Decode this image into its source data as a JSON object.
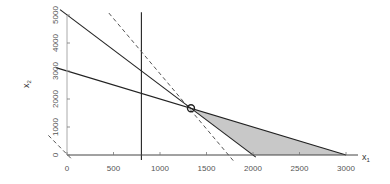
{
  "chart_data": {
    "type": "line",
    "title": "",
    "xlabel": "x1",
    "ylabel": "x2",
    "xlim": [
      0,
      3000
    ],
    "ylim": [
      0,
      5000
    ],
    "grid": false,
    "x_ticks": [
      0,
      500,
      1000,
      1500,
      2000,
      2500,
      3000
    ],
    "y_ticks": [
      0,
      1000,
      2000,
      3000,
      4000,
      5000
    ],
    "series": [
      {
        "name": "constraint-1",
        "style": "solid",
        "equation": "5x1 + 2x2 = 10000",
        "points": [
          [
            -75,
            5190
          ],
          [
            2030,
            -75
          ]
        ]
      },
      {
        "name": "constraint-2",
        "style": "solid",
        "equation": "x1 + x2 = 3000",
        "points": [
          [
            -120,
            3120
          ],
          [
            3000,
            0
          ]
        ]
      },
      {
        "name": "constraint-3",
        "style": "solid",
        "equation": "x1 = 800",
        "points": [
          [
            800,
            5100
          ],
          [
            800,
            -180
          ]
        ]
      },
      {
        "name": "objective-optimal",
        "style": "dashed",
        "equation": "4x1 + x2 = 7000",
        "points": [
          [
            450,
            5070
          ],
          [
            1800,
            -250
          ]
        ]
      },
      {
        "name": "objective-origin",
        "style": "dashed",
        "equation": "4x1 + x2 = 0",
        "points": [
          [
            -200,
            700
          ],
          [
            60,
            -180
          ]
        ]
      }
    ],
    "feasible_region": {
      "fill": "#c8c8c8",
      "vertices": [
        [
          1333,
          1667
        ],
        [
          3000,
          0
        ],
        [
          2000,
          0
        ]
      ]
    },
    "optimal_point": {
      "x": 1333,
      "y": 1667,
      "marker": "open-circle"
    }
  },
  "axes": {
    "x_label": "x",
    "x_label_sub": "1",
    "y_label": "x",
    "y_label_sub": "2"
  }
}
